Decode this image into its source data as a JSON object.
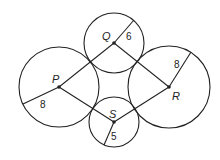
{
  "diagram": {
    "circles": [
      {
        "label": "P",
        "cx": 59,
        "cy": 87,
        "r": 40,
        "radius_label": "8",
        "radius_end": [
          23,
          104
        ],
        "label_pos": [
          52,
          83
        ],
        "radius_label_pos": [
          40,
          108
        ]
      },
      {
        "label": "Q",
        "cx": 114,
        "cy": 43,
        "r": 30,
        "radius_label": "6",
        "radius_end": [
          134,
          20
        ],
        "label_pos": [
          102,
          40
        ],
        "radius_label_pos": [
          126,
          40
        ]
      },
      {
        "label": "R",
        "cx": 169,
        "cy": 87,
        "r": 41,
        "radius_label": "8",
        "radius_end": [
          191,
          52
        ],
        "label_pos": [
          172,
          100
        ],
        "radius_label_pos": [
          174,
          68
        ]
      },
      {
        "label": "S",
        "cx": 114,
        "cy": 122,
        "r": 25,
        "radius_label": "5",
        "radius_end": [
          104,
          145
        ],
        "label_pos": [
          109,
          118
        ],
        "radius_label_pos": [
          111,
          140
        ]
      }
    ],
    "segments": [
      [
        "P",
        "Q"
      ],
      [
        "Q",
        "R"
      ],
      [
        "R",
        "S"
      ],
      [
        "S",
        "P"
      ]
    ],
    "stroke_color": "#222222"
  }
}
